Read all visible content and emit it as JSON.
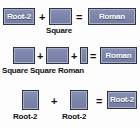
{
  "diagram": {
    "background_color": "#fdfdfd",
    "block_fill_color": "#7c86ab",
    "block_border_color": "#2f3342",
    "block_text_color": "#ffffff",
    "caption_text_color": "#121212",
    "operators": {
      "plus": "+",
      "equals": "="
    },
    "rows": [
      {
        "id": "row-1",
        "blocks": [
          {
            "label": "Root-2",
            "caption": ""
          },
          {
            "label": "",
            "caption": "Square"
          },
          {
            "label": "Roman",
            "caption": ""
          }
        ],
        "equation_text": "Root-2 + Square = Roman",
        "captions": [
          "Square"
        ]
      },
      {
        "id": "row-2",
        "blocks": [
          {
            "label": "",
            "caption": "Square"
          },
          {
            "label": "",
            "caption": "Square"
          },
          {
            "label": "",
            "caption": "Roman"
          },
          {
            "label": "Roman",
            "caption": ""
          }
        ],
        "equation_text": "Square + Square + Roman = Roman",
        "captions": [
          "Square",
          "Square",
          "Roman"
        ],
        "captions_line": "Square Square Roman"
      },
      {
        "id": "row-3",
        "blocks": [
          {
            "label": "",
            "caption": "Root-2"
          },
          {
            "label": "",
            "caption": "Root-2"
          },
          {
            "label": "Root-2",
            "caption": ""
          }
        ],
        "equation_text": "Root-2 + Root-2 = Root-2",
        "captions": [
          "Root-2",
          "Root-2"
        ]
      }
    ]
  }
}
